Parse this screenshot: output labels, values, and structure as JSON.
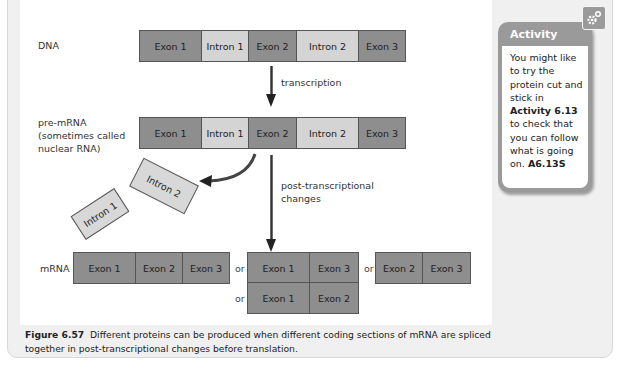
{
  "figure": {
    "rows": {
      "dna": {
        "label": "DNA",
        "segments": [
          {
            "label": "Exon 1",
            "type": "exon"
          },
          {
            "label": "Intron 1",
            "type": "intron"
          },
          {
            "label": "Exon 2",
            "type": "exon"
          },
          {
            "label": "Intron 2",
            "type": "intron"
          },
          {
            "label": "Exon 3",
            "type": "exon"
          }
        ]
      },
      "pre_mrna": {
        "label_line1": "pre-mRNA",
        "label_line2": "(sometimes called",
        "label_line3": "nuclear RNA)",
        "segments": [
          {
            "label": "Exon 1",
            "type": "exon"
          },
          {
            "label": "Intron 1",
            "type": "intron"
          },
          {
            "label": "Exon 2",
            "type": "exon"
          },
          {
            "label": "Intron 2",
            "type": "intron"
          },
          {
            "label": "Exon 3",
            "type": "exon"
          }
        ]
      },
      "mrna": {
        "label": "mRNA",
        "variants": [
          {
            "segments": [
              "Exon 1",
              "Exon 2",
              "Exon 3"
            ]
          },
          {
            "segments": [
              "Exon 1",
              "Exon 3"
            ]
          },
          {
            "segments": [
              "Exon 2",
              "Exon 3"
            ]
          },
          {
            "segments": [
              "Exon 1",
              "Exon 2"
            ]
          }
        ],
        "or_label": "or"
      }
    },
    "arrows": {
      "transcription": "transcription",
      "post_line1": "post-transcriptional",
      "post_line2": "changes"
    },
    "removed_introns": [
      "Intron 1",
      "Intron 2"
    ],
    "caption": {
      "number": "Figure 6.57",
      "text": "Different proteins can be produced when different coding sections of mRNA are spliced together in post-transcriptional changes before translation."
    }
  },
  "activity": {
    "title": "Activity",
    "body_before": "You might like to try the protein cut and stick in ",
    "activity_ref": "Activity 6.13",
    "body_middle": " to check that you can follow what is going on. ",
    "code": "A6.13S",
    "icon": "gear-icon"
  },
  "colors": {
    "exon": "#8e8e8e",
    "intron": "#d4d4d4",
    "activity_header": "#9a9a9a",
    "background": "#f0f0f0"
  }
}
